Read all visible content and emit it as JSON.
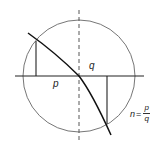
{
  "diagram": {
    "labels": {
      "q": "q",
      "p": "p",
      "n_lhs": "n",
      "equals": "=",
      "n_num": "p",
      "n_den": "q"
    },
    "geometry": {
      "circle": {
        "cx": 79,
        "cy": 76,
        "r": 56
      },
      "interface_line": {
        "x1": 15,
        "y1": 76,
        "x2": 144,
        "y2": 76
      },
      "normal_dashed": {
        "x1": 79,
        "y1": 10,
        "x2": 79,
        "y2": 141
      },
      "incident_ray": {
        "from": [
          28,
          33
        ],
        "to": [
          79,
          76
        ]
      },
      "refracted_ray": {
        "from": [
          79,
          76
        ],
        "to": [
          111,
          135
        ]
      },
      "left_perpendicular": {
        "x": 36,
        "y1": 41,
        "y2": 76
      },
      "right_perpendicular": {
        "x": 107,
        "y1": 76,
        "y2": 124
      }
    },
    "colors": {
      "stroke": "#222222",
      "circle": "#555555",
      "background": "#ffffff"
    }
  }
}
